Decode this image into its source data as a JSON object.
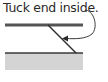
{
  "diagram": {
    "caption": "Tuck end inside.",
    "colors": {
      "text": "#2a2a2a",
      "line": "#3a3a3a",
      "top_bar": "#555555",
      "bottom_fill": "#d4d4d4"
    },
    "elements": [
      {
        "type": "text",
        "label": "Tuck end inside."
      },
      {
        "type": "curved-arrow",
        "from": "caption",
        "to": "diagonal-strap"
      },
      {
        "type": "top-bar"
      },
      {
        "type": "diagonal-strap"
      },
      {
        "type": "bottom-block"
      }
    ]
  }
}
